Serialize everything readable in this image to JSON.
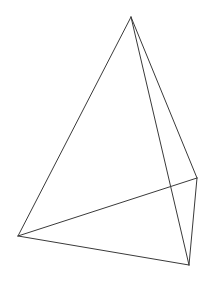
{
  "figure": {
    "name": "tetrahedron-wireframe",
    "type": "3d-wireframe-polyhedron",
    "shape_label": "tetrahedron",
    "canvas": {
      "width": 211,
      "height": 283
    },
    "background_color": "#ffffff",
    "stroke_color": "#3a3a3a",
    "stroke_width": 1,
    "vertices": [
      {
        "id": "apex",
        "label": "A",
        "x": 131,
        "y": 17
      },
      {
        "id": "left",
        "label": "B",
        "x": 18,
        "y": 236
      },
      {
        "id": "bottom-right",
        "label": "C",
        "x": 189,
        "y": 265
      },
      {
        "id": "right-middle",
        "label": "D",
        "x": 197,
        "y": 178
      }
    ],
    "edges": [
      {
        "id": "edge-apex-left",
        "from": "apex",
        "to": "left",
        "visible": true,
        "style": "solid"
      },
      {
        "id": "edge-apex-right-middle",
        "from": "apex",
        "to": "right-middle",
        "visible": true,
        "style": "solid"
      },
      {
        "id": "edge-apex-bottom-right",
        "from": "apex",
        "to": "bottom-right",
        "visible": true,
        "style": "solid"
      },
      {
        "id": "edge-left-bottom-right",
        "from": "left",
        "to": "bottom-right",
        "visible": true,
        "style": "solid"
      },
      {
        "id": "edge-left-right-middle",
        "from": "left",
        "to": "right-middle",
        "visible": true,
        "style": "solid"
      },
      {
        "id": "edge-right-middle-bottom-right",
        "from": "right-middle",
        "to": "bottom-right",
        "visible": true,
        "style": "solid"
      }
    ]
  }
}
